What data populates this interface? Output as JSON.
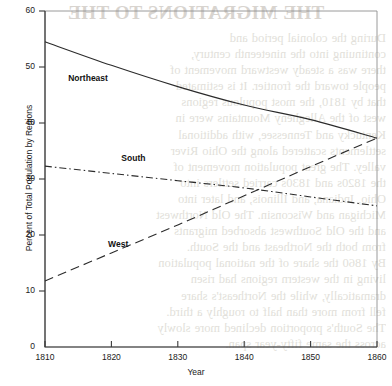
{
  "bleed_through": {
    "title": "THE MIGRATIONS TO THE",
    "lines": [
      "During the colonial period and",
      "continuing into the nineteenth century,",
      "there was a steady westward movement of",
      "people toward the frontier. It is estimated",
      "that by 1810, the most populous regions",
      "west of the Allegheny Mountains were in",
      "Kentucky and Tennessee, with additional",
      "settlements scattered along the Ohio River",
      "valley. The great population movement of",
      "the 1820s and 1830s carried settlers into",
      "Ohio, Indiana, and Illinois, and later into",
      "Michigan and Wisconsin. The Old Northwest",
      "and the Old Southwest absorbed migrants",
      "from both the Northeast and the South.",
      "By 1860 the share of the national population",
      "living in the western regions had risen",
      "dramatically, while the Northeast's share",
      "fell from more than half to roughly a third.",
      "The South's proportion declined more slowly",
      "across the same fifty-year span."
    ]
  },
  "chart_data": {
    "type": "line",
    "title": "",
    "xlabel": "Year",
    "ylabel": "Percent of Total Population by Regions",
    "x": [
      1810,
      1820,
      1830,
      1840,
      1850,
      1860
    ],
    "xlim": [
      1810,
      1860
    ],
    "ylim": [
      0,
      60
    ],
    "xticks": [
      1810,
      1820,
      1830,
      1840,
      1850,
      1860
    ],
    "yticks": [
      0,
      10,
      20,
      30,
      40,
      50,
      60
    ],
    "grid": false,
    "legend": "inline-labels",
    "series": [
      {
        "name": "Northeast",
        "style": "solid",
        "color": "#2b2b2b",
        "values": [
          54.5,
          50.3,
          46.5,
          43.2,
          40.6,
          37.3
        ],
        "label_x": 1813.5,
        "label_y": 47.8
      },
      {
        "name": "South",
        "style": "dashdot",
        "color": "#2b2b2b",
        "values": [
          32.3,
          31.0,
          29.7,
          28.4,
          26.8,
          25.2
        ],
        "label_x": 1821.5,
        "label_y": 33.6
      },
      {
        "name": "West",
        "style": "dashed",
        "color": "#2b2b2b",
        "values": [
          11.8,
          16.8,
          21.8,
          27.0,
          32.2,
          37.3
        ],
        "label_x": 1819.5,
        "label_y": 18.2
      }
    ]
  }
}
